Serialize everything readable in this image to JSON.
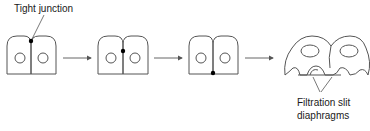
{
  "diagram": {
    "title": "",
    "labels": {
      "tight_junction": "Tight junction",
      "filtration_line1": "Filtration slit",
      "filtration_line2": "diaphragms"
    },
    "stages": [
      {
        "name": "stage-1",
        "junction_position": "apical"
      },
      {
        "name": "stage-2",
        "junction_position": "middle"
      },
      {
        "name": "stage-3",
        "junction_position": "basal"
      },
      {
        "name": "stage-4",
        "junction_position": "filtration-slit-diaphragm"
      }
    ],
    "colors": {
      "stroke": "#555555",
      "junction": "#000000",
      "text": "#1a1a1a"
    }
  }
}
